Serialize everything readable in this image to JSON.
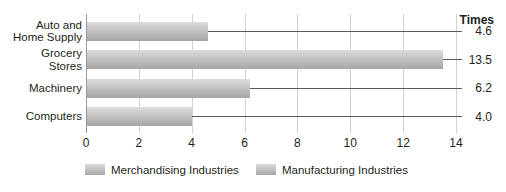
{
  "chart_data": {
    "type": "bar",
    "orientation": "horizontal",
    "title": "",
    "xlabel": "",
    "ylabel": "",
    "value_axis_title": "Times",
    "categories": [
      "Auto and Home Supply",
      "Grocery Stores",
      "Machinery",
      "Computers"
    ],
    "category_display_lines": [
      [
        "Auto and",
        "Home Supply"
      ],
      [
        "Grocery",
        "Stores"
      ],
      [
        "Machinery"
      ],
      [
        "Computers"
      ]
    ],
    "values": [
      4.6,
      13.5,
      6.2,
      4.0
    ],
    "value_labels": [
      "4.6",
      "13.5",
      "6.2",
      "4.0"
    ],
    "x_ticks": [
      "0",
      "2",
      "4",
      "6",
      "8",
      "10",
      "12",
      "14"
    ],
    "x_tick_values": [
      0,
      2,
      4,
      6,
      8,
      10,
      12,
      14
    ],
    "xlim": [
      0,
      14
    ],
    "grid": "vertical",
    "legend_position": "bottom",
    "legend": [
      "Merchandising Industries",
      "Manufacturing Industries"
    ],
    "colors": {
      "bar_gradient_top": "#dcdcdc",
      "bar_gradient_bottom": "#a5a5a5",
      "gridline": "#d2d2d2",
      "axis_line": "#9a9a9a",
      "leader_line": "#5a5a5a",
      "text": "#231f20",
      "background": "#ffffff"
    }
  }
}
